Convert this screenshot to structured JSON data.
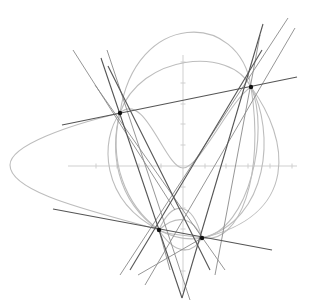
{
  "diagram": {
    "title": "",
    "size": {
      "width": 310,
      "height": 307
    },
    "colors": {
      "background": "#ffffff",
      "axis": "#cfcfcf",
      "conic": "#bdbdbd",
      "line_dark": "#555555",
      "line_mid": "#8a8a8a",
      "point": "#111111"
    },
    "axes": {
      "x_axis": {
        "x1": 68,
        "y1": 166,
        "x2": 297,
        "y2": 166
      },
      "y_axis": {
        "x1": 183,
        "y1": 55,
        "x2": 183,
        "y2": 292
      },
      "x_ticks": [
        96,
        117,
        139,
        161,
        205,
        226,
        248,
        270,
        292
      ],
      "y_ticks": [
        62,
        83,
        104,
        124,
        145,
        187,
        208,
        229,
        250,
        271
      ]
    },
    "points": [
      {
        "id": "P1",
        "x": 120,
        "y": 113
      },
      {
        "id": "P2",
        "x": 251,
        "y": 87
      },
      {
        "id": "P3",
        "x": 159,
        "y": 230
      },
      {
        "id": "P4",
        "x": 202,
        "y": 238
      }
    ],
    "conics": [
      {
        "d": "M120,113 C135,10 240,10 251,87 C265,175 240,245 202,238 C180,234 165,235 159,230 C115,200 110,150 120,113 Z"
      },
      {
        "d": "M120,113 C140,55 230,45 251,87 C270,130 250,230 202,238 C185,241 170,236 159,230 C125,205 108,160 120,113 Z"
      },
      {
        "d": "M120,113 C145,90 165,168 183,168 C200,168 230,100 251,87"
      },
      {
        "d": "M159,230 C172,200 192,200 202,238"
      },
      {
        "d": "M159,230 C175,255 192,255 202,238"
      },
      {
        "d": "M159,230 C175,215 192,215 202,238"
      },
      {
        "d": "M120,113 C70,125 10,145 10,165 C10,195 110,215 159,230"
      },
      {
        "d": "M120,113 C100,140 100,200 159,230"
      },
      {
        "d": "M251,87 C275,130 270,220 202,238"
      },
      {
        "d": "M251,87 C290,140 300,215 202,238"
      }
    ],
    "lines_dark": [
      {
        "x1": 62,
        "y1": 125,
        "x2": 297,
        "y2": 77
      },
      {
        "x1": 53,
        "y1": 209,
        "x2": 272,
        "y2": 250
      },
      {
        "x1": 101,
        "y1": 58,
        "x2": 182,
        "y2": 298
      },
      {
        "x1": 263,
        "y1": 24,
        "x2": 182,
        "y2": 298
      },
      {
        "x1": 108,
        "y1": 66,
        "x2": 210,
        "y2": 270
      },
      {
        "x1": 262,
        "y1": 50,
        "x2": 130,
        "y2": 270
      }
    ],
    "lines_mid": [
      {
        "x1": 73,
        "y1": 50,
        "x2": 175,
        "y2": 210
      },
      {
        "x1": 107,
        "y1": 50,
        "x2": 190,
        "y2": 300
      },
      {
        "x1": 95,
        "y1": 85,
        "x2": 225,
        "y2": 270
      },
      {
        "x1": 288,
        "y1": 18,
        "x2": 120,
        "y2": 275
      },
      {
        "x1": 295,
        "y1": 28,
        "x2": 145,
        "y2": 285
      },
      {
        "x1": 260,
        "y1": 35,
        "x2": 215,
        "y2": 275
      },
      {
        "x1": 138,
        "y1": 275,
        "x2": 202,
        "y2": 238
      },
      {
        "x1": 170,
        "y1": 270,
        "x2": 159,
        "y2": 230
      }
    ]
  }
}
